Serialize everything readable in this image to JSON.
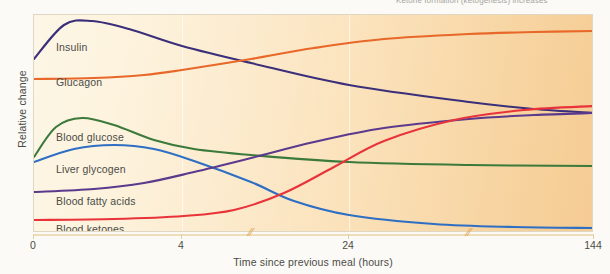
{
  "chart_data": {
    "type": "line",
    "title": "",
    "top_caption": "Ketone formation (ketogenesis) increases",
    "xlabel": "Time since previous meal (hours)",
    "ylabel": "Relative change",
    "grid": true,
    "grid_axis": "x",
    "legend_position": "inline-labels",
    "x_ticks": [
      {
        "label": "0",
        "px": 0
      },
      {
        "label": "4",
        "px": 148
      },
      {
        "label": "24",
        "px": 315
      },
      {
        "label": "144",
        "px": 560
      }
    ],
    "axis_breaks_px": [
      217,
      435
    ],
    "gridlines_px": [
      148,
      315
    ],
    "x": [
      0,
      4,
      24,
      144
    ],
    "xlim": [
      0,
      144
    ],
    "ylim": [
      0,
      1
    ],
    "background": {
      "left_color": "#fdf6e6",
      "right_color": "#f5cb93",
      "frame_color": "#e0d7c2"
    },
    "series": [
      {
        "name": "Insulin",
        "color": "#3B2F7A",
        "label_px": {
          "x": 22,
          "y": 26
        },
        "points": [
          {
            "px": 0,
            "py": 44
          },
          {
            "px": 30,
            "py": 10
          },
          {
            "px": 58,
            "py": 6
          },
          {
            "px": 95,
            "py": 14
          },
          {
            "px": 148,
            "py": 31
          },
          {
            "px": 217,
            "py": 48
          },
          {
            "px": 315,
            "py": 70
          },
          {
            "px": 435,
            "py": 87
          },
          {
            "px": 500,
            "py": 94
          },
          {
            "px": 560,
            "py": 98
          }
        ]
      },
      {
        "name": "Glucagon",
        "color": "#E8682A",
        "label_px": {
          "x": 22,
          "y": 61
        },
        "points": [
          {
            "px": 0,
            "py": 64
          },
          {
            "px": 60,
            "py": 63
          },
          {
            "px": 110,
            "py": 60
          },
          {
            "px": 148,
            "py": 55
          },
          {
            "px": 217,
            "py": 44
          },
          {
            "px": 280,
            "py": 33
          },
          {
            "px": 350,
            "py": 24
          },
          {
            "px": 435,
            "py": 19
          },
          {
            "px": 500,
            "py": 17
          },
          {
            "px": 560,
            "py": 16
          }
        ]
      },
      {
        "name": "Blood glucose",
        "color": "#3B7A3B",
        "label_px": {
          "x": 22,
          "y": 116
        },
        "points": [
          {
            "px": 0,
            "py": 142
          },
          {
            "px": 22,
            "py": 112
          },
          {
            "px": 48,
            "py": 103
          },
          {
            "px": 80,
            "py": 110
          },
          {
            "px": 120,
            "py": 125
          },
          {
            "px": 160,
            "py": 134
          },
          {
            "px": 217,
            "py": 140
          },
          {
            "px": 315,
            "py": 147
          },
          {
            "px": 435,
            "py": 150
          },
          {
            "px": 560,
            "py": 151
          }
        ]
      },
      {
        "name": "Liver glycogen",
        "color": "#2E6FC4",
        "label_px": {
          "x": 22,
          "y": 148
        },
        "points": [
          {
            "px": 0,
            "py": 147
          },
          {
            "px": 40,
            "py": 134
          },
          {
            "px": 80,
            "py": 130
          },
          {
            "px": 120,
            "py": 134
          },
          {
            "px": 160,
            "py": 146
          },
          {
            "px": 217,
            "py": 167
          },
          {
            "px": 260,
            "py": 186
          },
          {
            "px": 315,
            "py": 200
          },
          {
            "px": 400,
            "py": 209
          },
          {
            "px": 480,
            "py": 212
          },
          {
            "px": 560,
            "py": 213
          }
        ]
      },
      {
        "name": "Blood fatty acids",
        "color": "#5B3A8E",
        "label_px": {
          "x": 22,
          "y": 180
        },
        "points": [
          {
            "px": 0,
            "py": 177
          },
          {
            "px": 60,
            "py": 174
          },
          {
            "px": 110,
            "py": 168
          },
          {
            "px": 160,
            "py": 157
          },
          {
            "px": 217,
            "py": 143
          },
          {
            "px": 280,
            "py": 127
          },
          {
            "px": 350,
            "py": 113
          },
          {
            "px": 435,
            "py": 104
          },
          {
            "px": 500,
            "py": 100
          },
          {
            "px": 560,
            "py": 98
          }
        ]
      },
      {
        "name": "Blood ketones",
        "color": "#E8333A",
        "label_px": {
          "x": 22,
          "y": 208
        },
        "points": [
          {
            "px": 0,
            "py": 205
          },
          {
            "px": 80,
            "py": 204
          },
          {
            "px": 150,
            "py": 201
          },
          {
            "px": 200,
            "py": 195
          },
          {
            "px": 250,
            "py": 178
          },
          {
            "px": 300,
            "py": 152
          },
          {
            "px": 350,
            "py": 126
          },
          {
            "px": 420,
            "py": 105
          },
          {
            "px": 490,
            "py": 95
          },
          {
            "px": 560,
            "py": 91
          }
        ]
      }
    ]
  }
}
